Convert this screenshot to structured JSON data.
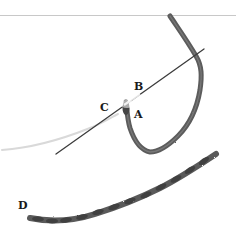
{
  "figure": {
    "labels": {
      "a": "A",
      "b": "B",
      "c": "C",
      "d": "D"
    },
    "colors": {
      "background": "#ffffff",
      "thread": "#5a5a5a",
      "thread_dark": "#3e3e3e",
      "needle": "#4a4a4a",
      "faint_thread": "#d6d6d6",
      "rule": "#c8c8c8"
    }
  }
}
